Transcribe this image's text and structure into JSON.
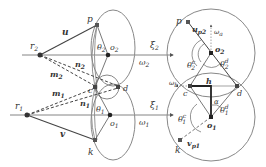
{
  "left_diagram": {
    "points": {
      "r2": {
        "label": "r",
        "sub": "2"
      },
      "r1": {
        "label": "r",
        "sub": "1"
      },
      "p": {
        "label": "p"
      },
      "c": {
        "label": "c"
      },
      "d": {
        "label": "d"
      },
      "k": {
        "label": "k"
      },
      "o2": {
        "label": "o",
        "sub": "2"
      },
      "o1": {
        "label": "o",
        "sub": "1"
      }
    },
    "vectors": {
      "u": "u",
      "v": "v",
      "m2": {
        "label": "m",
        "sub": "2"
      },
      "n2": {
        "label": "n",
        "sub": "2"
      },
      "m1": {
        "label": "m",
        "sub": "1"
      },
      "n1": {
        "label": "n",
        "sub": "1"
      }
    },
    "angles": {
      "theta2": {
        "label": "θ",
        "sub": "2"
      },
      "theta1": {
        "label": "θ",
        "sub": "1"
      }
    },
    "axes": {
      "xi2": {
        "label": "ξ",
        "sub": "2"
      },
      "omega2": {
        "label": "ω",
        "sub": "2"
      },
      "xi1": {
        "label": "ξ",
        "sub": "1"
      },
      "omega1": {
        "label": "ω",
        "sub": "1"
      }
    }
  },
  "right_diagram": {
    "points": {
      "p": {
        "label": "p"
      },
      "c": {
        "label": "c"
      },
      "d": {
        "label": "d"
      },
      "k": {
        "label": "k"
      },
      "o2": {
        "label": "o",
        "sub": "2"
      },
      "o1": {
        "label": "o",
        "sub": "1"
      }
    },
    "vectors": {
      "up2": {
        "label": "u",
        "sub": "p2"
      },
      "vp1": {
        "label": "v",
        "sub": "p1"
      }
    },
    "angles": {
      "theta2c": {
        "label": "θ",
        "sub": "2",
        "sup": "c"
      },
      "theta2d": {
        "label": "θ",
        "sub": "2",
        "sup": "d"
      },
      "theta1c": {
        "label": "θ",
        "sub": "1",
        "sup": "c"
      },
      "theta1d": {
        "label": "θ",
        "sub": "1",
        "sup": "d"
      },
      "alpha": {
        "label": "α"
      }
    },
    "axes": {
      "omega_a": {
        "label": "ω",
        "sub": "a"
      },
      "omega_b": {
        "label": "ω",
        "sub": "b"
      }
    },
    "segments": {
      "h": "h"
    }
  },
  "colors": {
    "stroke": "#555555",
    "curve": "#888888",
    "point": "#333333",
    "text": "#333333"
  }
}
